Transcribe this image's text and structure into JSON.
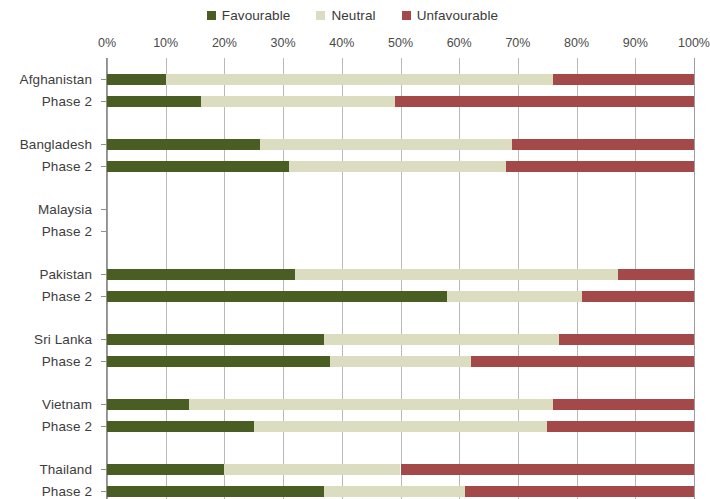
{
  "legend": {
    "items": [
      {
        "label": "Favourable",
        "color": "#4a5d23",
        "icon": "square-marker-icon"
      },
      {
        "label": "Neutral",
        "color": "#dcdcc0",
        "icon": "square-marker-icon"
      },
      {
        "label": "Unfavourable",
        "color": "#a4494a",
        "icon": "square-marker-icon"
      }
    ]
  },
  "chart_data": {
    "type": "bar",
    "title": "",
    "subtitle": "",
    "xlabel": "",
    "ylabel": "",
    "orientation": "horizontal",
    "stacked": true,
    "stack_mode": "percent",
    "grid": true,
    "legend_position": "top-center",
    "xlim": [
      0,
      100
    ],
    "xticks": [
      0,
      10,
      20,
      30,
      40,
      50,
      60,
      70,
      80,
      90,
      100
    ],
    "xtick_labels": [
      "0%",
      "10%",
      "20%",
      "30%",
      "40%",
      "50%",
      "60%",
      "70%",
      "80%",
      "90%",
      "100%"
    ],
    "series": [
      {
        "name": "Favourable",
        "color": "#4a5d23"
      },
      {
        "name": "Neutral",
        "color": "#dcdcc0"
      },
      {
        "name": "Unfavourable",
        "color": "#a4494a"
      }
    ],
    "groups": [
      {
        "name": "Afghanistan",
        "rows": [
          {
            "label": "Afghanistan",
            "values": [
              10,
              66,
              24
            ],
            "has_data": true
          },
          {
            "label": "Phase 2",
            "values": [
              16,
              33,
              51
            ],
            "has_data": true
          }
        ]
      },
      {
        "name": "Bangladesh",
        "rows": [
          {
            "label": "Bangladesh",
            "values": [
              26,
              43,
              31
            ],
            "has_data": true
          },
          {
            "label": "Phase 2",
            "values": [
              31,
              37,
              32
            ],
            "has_data": true
          }
        ]
      },
      {
        "name": "Malaysia",
        "rows": [
          {
            "label": "Malaysia",
            "values": [
              0,
              0,
              0
            ],
            "has_data": false
          },
          {
            "label": "Phase 2",
            "values": [
              0,
              0,
              0
            ],
            "has_data": false
          }
        ]
      },
      {
        "name": "Pakistan",
        "rows": [
          {
            "label": "Pakistan",
            "values": [
              32,
              55,
              13
            ],
            "has_data": true
          },
          {
            "label": "Phase 2",
            "values": [
              58,
              23,
              19
            ],
            "has_data": true
          }
        ]
      },
      {
        "name": "Sri Lanka",
        "rows": [
          {
            "label": "Sri Lanka",
            "values": [
              37,
              40,
              23
            ],
            "has_data": true
          },
          {
            "label": "Phase 2",
            "values": [
              38,
              24,
              38
            ],
            "has_data": true
          }
        ]
      },
      {
        "name": "Vietnam",
        "rows": [
          {
            "label": "Vietnam",
            "values": [
              14,
              62,
              24
            ],
            "has_data": true
          },
          {
            "label": "Phase 2",
            "values": [
              25,
              50,
              25
            ],
            "has_data": true
          }
        ]
      },
      {
        "name": "Thailand",
        "rows": [
          {
            "label": "Thailand",
            "values": [
              20,
              30,
              50
            ],
            "has_data": true
          },
          {
            "label": "Phase 2",
            "values": [
              37,
              24,
              39
            ],
            "has_data": true
          }
        ]
      }
    ]
  }
}
